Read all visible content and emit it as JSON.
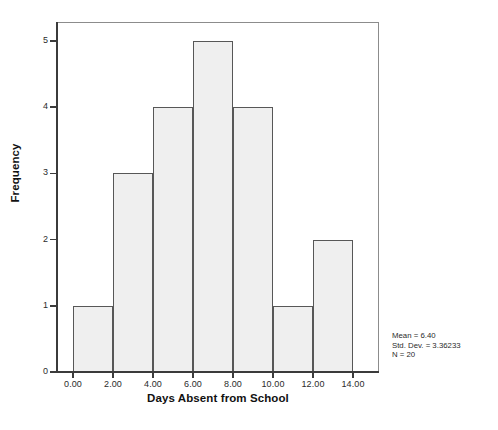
{
  "chart_data": {
    "type": "bar",
    "subtype": "histogram",
    "title": "",
    "xlabel": "Days Absent from School",
    "ylabel": "Frequency",
    "xlim": [
      -1.0,
      15.0
    ],
    "ylim": [
      0,
      5.3
    ],
    "grid": false,
    "legend": null,
    "bin_width": 2,
    "bin_edges": [
      0,
      2,
      4,
      6,
      8,
      10,
      12,
      14
    ],
    "categories": [
      "0-2",
      "2-4",
      "4-6",
      "6-8",
      "8-10",
      "10-12",
      "12-14"
    ],
    "values": [
      1,
      3,
      4,
      5,
      4,
      1,
      2
    ],
    "bars": [
      {
        "x0": 0,
        "x1": 2,
        "frequency": 1
      },
      {
        "x0": 2,
        "x1": 4,
        "frequency": 3
      },
      {
        "x0": 4,
        "x1": 6,
        "frequency": 4
      },
      {
        "x0": 6,
        "x1": 8,
        "frequency": 5
      },
      {
        "x0": 8,
        "x1": 10,
        "frequency": 4
      },
      {
        "x0": 10,
        "x1": 12,
        "frequency": 1
      },
      {
        "x0": 12,
        "x1": 14,
        "frequency": 2
      }
    ],
    "xticks": [
      0,
      2,
      4,
      6,
      8,
      10,
      12,
      14
    ],
    "xticklabels": [
      "0.00",
      "2.00",
      "4.00",
      "6.00",
      "8.00",
      "10.00",
      "12.00",
      "14.00"
    ],
    "yticks": [
      0,
      1,
      2,
      3,
      4,
      5
    ],
    "yticklabels": [
      "0",
      "1",
      "2",
      "3",
      "4",
      "5"
    ],
    "annotations": [
      "Mean = 6.40",
      "Std. Dev. = 3.36233",
      "N = 20"
    ],
    "colors": {
      "bar_fill": "#efefef",
      "bar_border": "#575757",
      "axis": "#3b3b3b",
      "frame": "#8c8c8c",
      "text": "#1a1a1a",
      "background": "#ffffff"
    }
  },
  "statistics": {
    "mean_label": "Mean = 6.40",
    "std_dev_label": "Std. Dev. = 3.36233",
    "n_label": "N = 20"
  }
}
